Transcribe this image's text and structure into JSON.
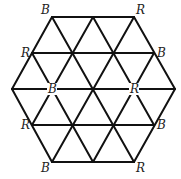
{
  "diagram": {
    "width": 181,
    "height": 179,
    "line_color": "#111111",
    "label_color": "#222222",
    "rows_y": [
      17,
      53,
      89,
      125,
      162
    ],
    "vertices": [
      {
        "id": "v0",
        "x": 52,
        "y": 17
      },
      {
        "id": "v1",
        "x": 93,
        "y": 17
      },
      {
        "id": "v2",
        "x": 134,
        "y": 17
      },
      {
        "id": "v3",
        "x": 32,
        "y": 53
      },
      {
        "id": "v4",
        "x": 72,
        "y": 53
      },
      {
        "id": "v5",
        "x": 113,
        "y": 53
      },
      {
        "id": "v6",
        "x": 154,
        "y": 53
      },
      {
        "id": "v7",
        "x": 12,
        "y": 89
      },
      {
        "id": "v8",
        "x": 52,
        "y": 89
      },
      {
        "id": "v9",
        "x": 93,
        "y": 89
      },
      {
        "id": "v10",
        "x": 134,
        "y": 89
      },
      {
        "id": "v11",
        "x": 175,
        "y": 89
      },
      {
        "id": "v12",
        "x": 32,
        "y": 125
      },
      {
        "id": "v13",
        "x": 72,
        "y": 125
      },
      {
        "id": "v14",
        "x": 113,
        "y": 125
      },
      {
        "id": "v15",
        "x": 154,
        "y": 125
      },
      {
        "id": "v16",
        "x": 52,
        "y": 162
      },
      {
        "id": "v17",
        "x": 93,
        "y": 162
      },
      {
        "id": "v18",
        "x": 134,
        "y": 162
      }
    ],
    "horizontal_lines": [
      {
        "x1": 52,
        "y1": 17,
        "x2": 134,
        "y2": 17
      },
      {
        "x1": 32,
        "y1": 53,
        "x2": 154,
        "y2": 53
      },
      {
        "x1": 12,
        "y1": 89,
        "x2": 175,
        "y2": 89
      },
      {
        "x1": 32,
        "y1": 125,
        "x2": 154,
        "y2": 125
      },
      {
        "x1": 52,
        "y1": 162,
        "x2": 134,
        "y2": 162
      }
    ],
    "down_right_lines": [
      {
        "x1": 12,
        "y1": 89,
        "x2": 52,
        "y2": 162
      },
      {
        "x1": 32,
        "y1": 53,
        "x2": 93,
        "y2": 162
      },
      {
        "x1": 52,
        "y1": 17,
        "x2": 134,
        "y2": 162
      },
      {
        "x1": 93,
        "y1": 17,
        "x2": 154,
        "y2": 125
      },
      {
        "x1": 134,
        "y1": 17,
        "x2": 175,
        "y2": 89
      }
    ],
    "down_left_lines": [
      {
        "x1": 52,
        "y1": 17,
        "x2": 12,
        "y2": 89
      },
      {
        "x1": 93,
        "y1": 17,
        "x2": 32,
        "y2": 125
      },
      {
        "x1": 134,
        "y1": 17,
        "x2": 52,
        "y2": 162
      },
      {
        "x1": 154,
        "y1": 53,
        "x2": 93,
        "y2": 162
      },
      {
        "x1": 175,
        "y1": 89,
        "x2": 134,
        "y2": 162
      }
    ],
    "labels": [
      {
        "text": "B",
        "vertex": "v0",
        "x": 41,
        "y": 14,
        "masked": false
      },
      {
        "text": "R",
        "vertex": "v2",
        "x": 136,
        "y": 14,
        "masked": false
      },
      {
        "text": "R",
        "vertex": "v3",
        "x": 21,
        "y": 57,
        "masked": false
      },
      {
        "text": "B",
        "vertex": "v6",
        "x": 157,
        "y": 57,
        "masked": false
      },
      {
        "text": "B",
        "vertex": "v8",
        "x": 48,
        "y": 93,
        "masked": true
      },
      {
        "text": "R",
        "vertex": "v10",
        "x": 130,
        "y": 93,
        "masked": true
      },
      {
        "text": "R",
        "vertex": "v12",
        "x": 21,
        "y": 129,
        "masked": false
      },
      {
        "text": "B",
        "vertex": "v15",
        "x": 157,
        "y": 129,
        "masked": false
      },
      {
        "text": "B",
        "vertex": "v16",
        "x": 41,
        "y": 172,
        "masked": false
      },
      {
        "text": "R",
        "vertex": "v18",
        "x": 136,
        "y": 172,
        "masked": false
      }
    ]
  }
}
